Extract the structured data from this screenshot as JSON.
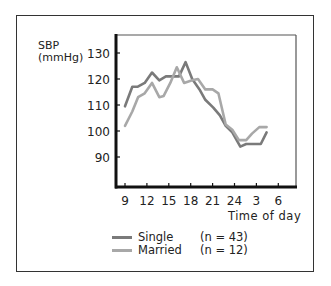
{
  "chart_data": {
    "type": "line",
    "title": "",
    "ylabel": "SBP (mmHg)",
    "ylabel_lines": [
      "SBP",
      "(mmHg)"
    ],
    "xlabel": "Time of day",
    "ylim": [
      80,
      135
    ],
    "yticks": [
      90,
      100,
      110,
      120,
      130
    ],
    "xtick_labels": [
      "9",
      "12",
      "15",
      "18",
      "21",
      "24",
      "3",
      "6"
    ],
    "x": [
      9,
      10.5,
      12,
      13.5,
      15,
      16.5,
      18,
      19.5,
      21,
      22.5,
      24,
      25.5,
      27,
      28.5,
      30
    ],
    "grid": false,
    "legend_position": "below",
    "series": [
      {
        "name": "Single",
        "n_label": "(n = 43)",
        "color": "#7a7a7a",
        "points": [
          [
            9,
            109.5
          ],
          [
            10,
            117
          ],
          [
            10.7,
            117
          ],
          [
            11.7,
            118.5
          ],
          [
            12.7,
            122.5
          ],
          [
            13.7,
            119.5
          ],
          [
            14.6,
            121
          ],
          [
            15.6,
            121
          ],
          [
            16.4,
            121
          ],
          [
            17.3,
            126.5
          ],
          [
            18.2,
            120
          ],
          [
            19.2,
            116
          ],
          [
            20,
            112
          ],
          [
            21.1,
            109
          ],
          [
            22,
            106
          ],
          [
            22.8,
            102
          ],
          [
            23.7,
            99.5
          ],
          [
            24.8,
            94
          ],
          [
            25.6,
            95
          ],
          [
            26.7,
            95
          ],
          [
            27.6,
            95
          ],
          [
            28.4,
            99.5
          ]
        ]
      },
      {
        "name": "Married",
        "n_label": "(n = 12)",
        "color": "#a8a8a8",
        "points": [
          [
            9,
            102
          ],
          [
            10,
            107.5
          ],
          [
            10.8,
            113
          ],
          [
            11.7,
            114.5
          ],
          [
            12.7,
            118.5
          ],
          [
            13.7,
            113
          ],
          [
            14.3,
            113.5
          ],
          [
            15.2,
            118.5
          ],
          [
            16.1,
            124.5
          ],
          [
            17.1,
            118.5
          ],
          [
            18.2,
            119.5
          ],
          [
            19,
            120
          ],
          [
            20,
            116
          ],
          [
            21,
            116
          ],
          [
            21.8,
            114.5
          ],
          [
            22.8,
            102.5
          ],
          [
            23.7,
            100.5
          ],
          [
            24.6,
            96.5
          ],
          [
            25.6,
            96.5
          ],
          [
            26.4,
            99
          ],
          [
            27.4,
            101.5
          ],
          [
            28.4,
            101.5
          ]
        ]
      }
    ]
  },
  "labels": {
    "y_line1": "SBP",
    "y_line2": "(mmHg)",
    "x_axis": "Time of day"
  },
  "legend": [
    {
      "name": "Single",
      "n": "(n = 43)",
      "color": "#7a7a7a"
    },
    {
      "name": "Married",
      "n": "(n = 12)",
      "color": "#a8a8a8"
    }
  ]
}
